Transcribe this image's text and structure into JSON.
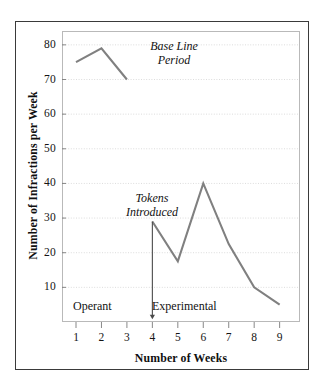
{
  "figure": {
    "outer_border_color": "#3a3a3a",
    "plot_frame_color": "#b9b9b9",
    "background": "#ffffff"
  },
  "chart_data": {
    "type": "line",
    "title": "",
    "xlabel": "Number of Weeks",
    "ylabel": "Number of Infractions per Week",
    "xlim": [
      0.45,
      9.8
    ],
    "ylim": [
      0,
      84
    ],
    "xticks": [
      1,
      2,
      3,
      4,
      5,
      6,
      7,
      8,
      9
    ],
    "xtick_labels": [
      "1",
      "2",
      "3",
      "4",
      "5",
      "6",
      "7",
      "8",
      "9"
    ],
    "yticks": [
      10,
      20,
      30,
      40,
      50,
      60,
      70,
      80
    ],
    "ytick_labels": [
      "10",
      "20",
      "30",
      "40",
      "50",
      "60",
      "70",
      "80"
    ],
    "grid": true,
    "grid_style": "dotted",
    "grid_color": "#d8d8d8",
    "legend": null,
    "line_color": "#808080",
    "line_width": 2.1,
    "series": [
      {
        "name": "Base Line Period",
        "x": [
          1,
          2,
          3
        ],
        "values": [
          75,
          79,
          70
        ]
      },
      {
        "name": "Experimental Period",
        "x": [
          4,
          5,
          6,
          7,
          8,
          9
        ],
        "values": [
          29,
          17.5,
          40,
          22.5,
          10,
          5
        ]
      }
    ],
    "annotations": [
      {
        "name": "base-line-period",
        "text_lines": [
          "Base Line",
          "Period"
        ],
        "style": "italic",
        "x": 4.55,
        "y": 76
      },
      {
        "name": "tokens-introduced",
        "text_lines": [
          "Tokens",
          "Introduced"
        ],
        "style": "italic",
        "x": 3.75,
        "y": 35.5
      },
      {
        "name": "operant-phase-label",
        "text_lines": [
          "Operant"
        ],
        "style": "plain",
        "x": 2.0,
        "y": 6.5
      },
      {
        "name": "experimental-phase-label",
        "text_lines": [
          "Experimental"
        ],
        "style": "plain",
        "x": 5.6,
        "y": 6.5
      }
    ],
    "arrow": {
      "name": "tokens-introduced-arrow",
      "x": 4,
      "y_start": 29,
      "y_end": 0.8,
      "color": "#4a4a4a",
      "direction": "down"
    }
  },
  "labels": {
    "y_axis_title": "Number of Infractions per Week",
    "x_axis_title": "Number of Weeks",
    "baseline_line1": "Base Line",
    "baseline_line2": "Period",
    "tokens_line1": "Tokens",
    "tokens_line2": "Introduced",
    "operant": "Operant",
    "experimental": "Experimental"
  }
}
